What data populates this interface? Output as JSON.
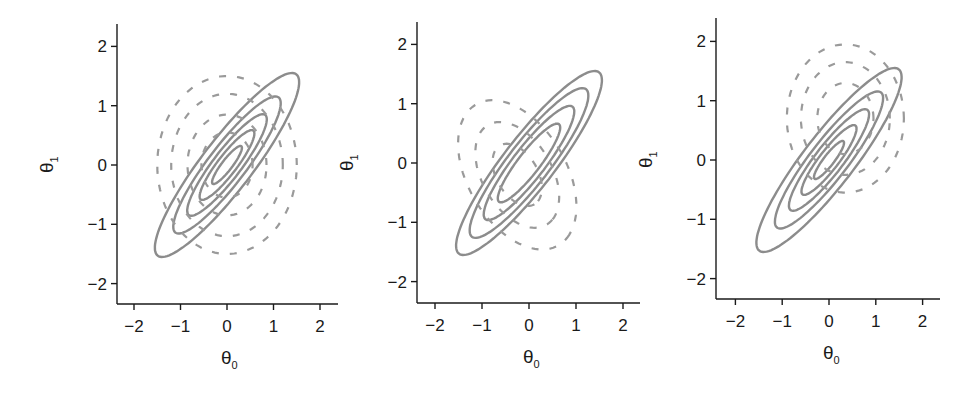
{
  "chart_data": [
    {
      "type": "contour",
      "panel": 1,
      "title": "",
      "xlabel": "θ0",
      "ylabel": "θ1",
      "xlim": [
        -2.4,
        2.4
      ],
      "ylim": [
        -2.4,
        2.4
      ],
      "xticks": [
        -2,
        -1,
        0,
        1,
        2
      ],
      "yticks": [
        -2,
        -1,
        0,
        1,
        2
      ],
      "tick_labels": [
        "−2",
        "−1",
        "0",
        "1",
        "2"
      ],
      "grid": false,
      "solid_contours": {
        "description": "correlated Gaussian contours",
        "center": [
          0,
          0
        ],
        "correlation": 0.9,
        "levels_scale": [
          0.3,
          0.55,
          0.8,
          1.08,
          1.45
        ]
      },
      "dashed_contours": {
        "description": "isotropic circular contours (partially visible)",
        "center": [
          0,
          0
        ],
        "radii": [
          0.55,
          0.85,
          1.2,
          1.5
        ]
      },
      "px": {
        "x0": 227,
        "xscale": 46.5,
        "y0": 165,
        "yscale": 59.3,
        "xaxis_y": 304,
        "yaxis_x": 117,
        "xaxis_end": 338,
        "yaxis_top": 24
      }
    },
    {
      "type": "contour",
      "panel": 2,
      "title": "",
      "xlabel": "θ0",
      "ylabel": "θ1",
      "xlim": [
        -2.4,
        2.4
      ],
      "ylim": [
        -2.4,
        2.4
      ],
      "xticks": [
        -2,
        -1,
        0,
        1,
        2
      ],
      "yticks": [
        -2,
        -1,
        0,
        1,
        2
      ],
      "tick_labels": [
        "−2",
        "−1",
        "0",
        "1",
        "2"
      ],
      "grid": false,
      "solid_contours": {
        "description": "correlated Gaussian contours",
        "center": [
          0,
          0
        ],
        "correlation": 0.9,
        "levels_scale": [
          0.62,
          0.9,
          1.18,
          1.45
        ]
      },
      "dashed_contours": {
        "description": "anti-correlated contours (partially visible)",
        "center": [
          -0.25,
          -0.2
        ],
        "radii": [
          0.5,
          0.85,
          1.2
        ]
      },
      "px": {
        "x0": 529,
        "xscale": 47,
        "y0": 163,
        "yscale": 59.3,
        "xaxis_y": 303,
        "yaxis_x": 417,
        "xaxis_end": 640,
        "yaxis_top": 22
      }
    },
    {
      "type": "contour",
      "panel": 3,
      "title": "",
      "xlabel": "θ0",
      "ylabel": "θ1",
      "xlim": [
        -2.4,
        2.4
      ],
      "ylim": [
        -2.4,
        2.4
      ],
      "xticks": [
        -2,
        -1,
        0,
        1,
        2
      ],
      "yticks": [
        -2,
        -1,
        0,
        1,
        2
      ],
      "tick_labels": [
        "−2",
        "−1",
        "0",
        "1",
        "2"
      ],
      "grid": false,
      "solid_contours": {
        "description": "correlated Gaussian contours",
        "center": [
          0,
          0
        ],
        "correlation": 0.9,
        "levels_scale": [
          0.3,
          0.55,
          0.8,
          1.08,
          1.45
        ]
      },
      "dashed_contours": {
        "description": "isotropic circular contours, shifted (partially visible)",
        "center": [
          0.35,
          0.7
        ],
        "radii": [
          0.6,
          0.95,
          1.25
        ]
      },
      "px": {
        "x0": 829,
        "xscale": 46.8,
        "y0": 160,
        "yscale": 59.3,
        "xaxis_y": 299,
        "yaxis_x": 716,
        "xaxis_end": 940,
        "yaxis_top": 18
      }
    }
  ],
  "labels": {
    "x_main": "θ",
    "x_sub": "0",
    "y_main": "θ",
    "y_sub": "1"
  },
  "colors": {
    "solid": "#8c8c8c",
    "dashed": "#9a9a9a",
    "axis": "#1a1a1a"
  }
}
